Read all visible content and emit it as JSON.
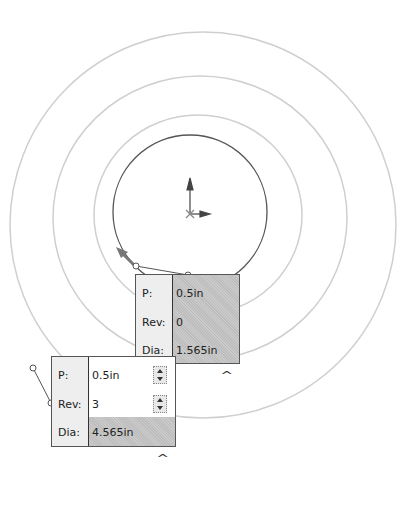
{
  "popup_inner": {
    "rows": [
      {
        "label": "P:",
        "value": "0.5in"
      },
      {
        "label": "Rev:",
        "value": "0"
      },
      {
        "label": "Dia:",
        "value": "1.565in"
      }
    ],
    "collapse_caret": "^"
  },
  "popup_outer": {
    "rows": [
      {
        "label": "P:",
        "value": "0.5in"
      },
      {
        "label": "Rev:",
        "value": "3"
      },
      {
        "label": "Dia:",
        "value": "4.565in"
      }
    ],
    "collapse_caret": "^"
  },
  "colors": {
    "circle": "#555555",
    "preview_rings": "#cfcfcf",
    "shaded_field": "#c4c4c4"
  }
}
